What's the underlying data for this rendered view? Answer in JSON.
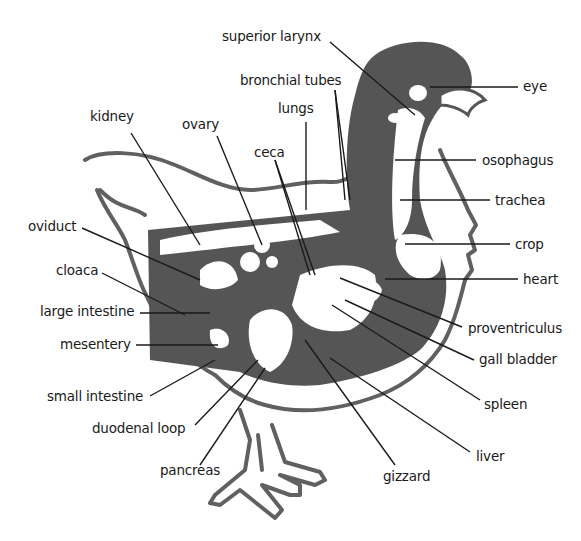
{
  "diagram": {
    "colors": {
      "ink": "#1a1a1a",
      "fill_dark": "#555555",
      "outline": "#606060",
      "background": "#ffffff"
    },
    "labels": [
      {
        "id": "superior-larynx",
        "text": "superior  larynx",
        "x": 222,
        "y": 28
      },
      {
        "id": "bronchial-tubes",
        "text": "bronchial tubes",
        "x": 240,
        "y": 72
      },
      {
        "id": "lungs",
        "text": "lungs",
        "x": 278,
        "y": 100
      },
      {
        "id": "kidney",
        "text": "kidney",
        "x": 90,
        "y": 108
      },
      {
        "id": "ovary",
        "text": "ovary",
        "x": 182,
        "y": 116
      },
      {
        "id": "ceca",
        "text": "ceca",
        "x": 254,
        "y": 144
      },
      {
        "id": "eye",
        "text": "eye",
        "x": 523,
        "y": 78
      },
      {
        "id": "osophagus",
        "text": "osophagus",
        "x": 482,
        "y": 152
      },
      {
        "id": "trachea",
        "text": "trachea",
        "x": 495,
        "y": 192
      },
      {
        "id": "crop",
        "text": "crop",
        "x": 515,
        "y": 236
      },
      {
        "id": "heart",
        "text": "heart",
        "x": 523,
        "y": 271
      },
      {
        "id": "oviduct",
        "text": "oviduct",
        "x": 28,
        "y": 218
      },
      {
        "id": "cloaca",
        "text": "cloaca",
        "x": 56,
        "y": 262
      },
      {
        "id": "large-intestine",
        "text": "large intestine",
        "x": 40,
        "y": 303
      },
      {
        "id": "mesentery",
        "text": "mesentery",
        "x": 60,
        "y": 336
      },
      {
        "id": "proventriculus",
        "text": "proventriculus",
        "x": 468,
        "y": 320
      },
      {
        "id": "gall-bladder",
        "text": "gall bladder",
        "x": 479,
        "y": 351
      },
      {
        "id": "spleen",
        "text": "spleen",
        "x": 484,
        "y": 396
      },
      {
        "id": "small-intestine",
        "text": "small intestine",
        "x": 47,
        "y": 388
      },
      {
        "id": "duodenal-loop",
        "text": "duodenal loop",
        "x": 92,
        "y": 420
      },
      {
        "id": "liver",
        "text": "liver",
        "x": 476,
        "y": 448
      },
      {
        "id": "pancreas",
        "text": "pancreas",
        "x": 160,
        "y": 462
      },
      {
        "id": "gizzard",
        "text": "gizzard",
        "x": 383,
        "y": 468
      }
    ]
  }
}
